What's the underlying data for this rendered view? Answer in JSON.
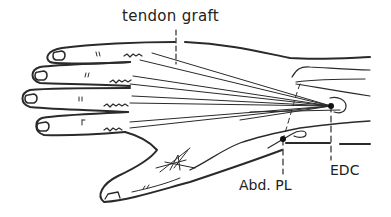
{
  "diagram": {
    "labels": {
      "tendon_graft": "tendon graft",
      "abd_pl": "Abd. PL",
      "edc": "EDC"
    },
    "colors": {
      "line": "#2a2a2a",
      "background": "#ffffff",
      "text": "#222222"
    },
    "points": [
      {
        "name": "EDC",
        "x": 331,
        "y": 106
      },
      {
        "name": "Abd. PL",
        "x": 283,
        "y": 139
      }
    ]
  }
}
